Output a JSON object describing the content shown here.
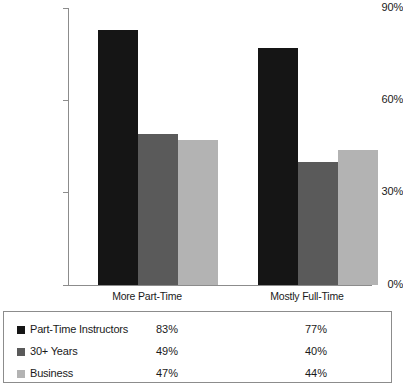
{
  "chart_data": {
    "type": "bar",
    "title": "",
    "subtitle": "",
    "xlabel": "",
    "ylabel": "",
    "categories": [
      "More Part-Time",
      "Mostly Full-Time"
    ],
    "series": [
      {
        "name": "Part-Time Instructors",
        "values": [
          83,
          77
        ],
        "labels": [
          "83%",
          "77%"
        ],
        "color": "#151515"
      },
      {
        "name": "30+ Years",
        "values": [
          49,
          40
        ],
        "labels": [
          "49%",
          "40%"
        ],
        "color": "#5a5a5a"
      },
      {
        "name": "Business",
        "values": [
          47,
          44
        ],
        "labels": [
          "47%",
          "44%"
        ],
        "color": "#b3b3b3"
      }
    ],
    "ylim": [
      0,
      90
    ],
    "yticks": [
      0,
      30,
      60,
      90
    ],
    "ytick_labels": [
      "0%",
      "30%",
      "60%",
      "90%"
    ],
    "grid": false,
    "legend_position": "bottom-table",
    "value_suffix": "%"
  },
  "axis": {
    "y_labels": [
      "90%",
      "60%",
      "30%",
      "0%"
    ],
    "x_labels": [
      "More Part-Time",
      "Mostly Full-Time"
    ]
  },
  "legend": {
    "rows": [
      {
        "label": "Part-Time Instructors",
        "v1": "83%",
        "v2": "77%",
        "swatch": "#151515"
      },
      {
        "label": "30+ Years",
        "v1": "49%",
        "v2": "40%",
        "swatch": "#5a5a5a"
      },
      {
        "label": "Business",
        "v1": "47%",
        "v2": "44%",
        "swatch": "#b3b3b3"
      }
    ]
  },
  "colors": {
    "axis": "#8c8c8c",
    "text": "#1a1a1a",
    "background": "#ffffff",
    "series_1": "#151515",
    "series_2": "#5a5a5a",
    "series_3": "#b3b3b3"
  }
}
